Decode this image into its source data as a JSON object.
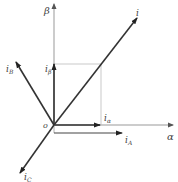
{
  "diagram": {
    "type": "vector-diagram",
    "origin": {
      "label": "o",
      "x": 54,
      "y": 125
    },
    "axes": {
      "alpha": {
        "label": "α"
      },
      "beta": {
        "label": "β"
      }
    },
    "vectors": {
      "i": {
        "label": "i"
      },
      "i_alpha": {
        "label": "i",
        "sub": "α"
      },
      "i_beta": {
        "label": "i",
        "sub": "β"
      },
      "i_A": {
        "label": "i",
        "sub": "A"
      },
      "i_B": {
        "label": "i",
        "sub": "B"
      },
      "i_C": {
        "label": "i",
        "sub": "C"
      }
    },
    "colors": {
      "axis": "#888888",
      "vector": "#333333",
      "projection": "#aaaaaa",
      "label": "#444444"
    }
  }
}
